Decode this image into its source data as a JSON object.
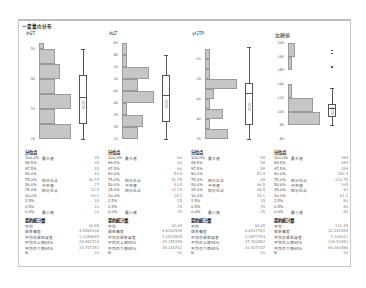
{
  "title": "一変量の分布",
  "colors": {
    "bar_fill": "#c6c6c6",
    "bar_stroke": "#9a9a9a",
    "box_stroke": "#555555",
    "frame": "#c8c8c8"
  },
  "quantile_header": "分位点",
  "summary_header": "要約統計量",
  "quantile_levels": [
    "100.0%",
    "99.5%",
    "97.5%",
    "90.0%",
    "75.0%",
    "50.0%",
    "25.0%",
    "10.0%",
    "2.5%",
    "0.5%",
    "0.0%"
  ],
  "quantile_labels": [
    "最大値",
    "",
    "",
    "",
    "四分位点",
    "中央値",
    "四分位点",
    "",
    "",
    "",
    "最小値"
  ],
  "summary_labels": [
    "平均",
    "標準偏差",
    "平均の標準誤差",
    "平均の上側95%",
    "平均の下側95%",
    "N"
  ],
  "columns": [
    {
      "name": "AST",
      "ticks": [
        "35",
        "30",
        "25",
        "20"
      ],
      "quantiles": [
        "35",
        "35",
        "35",
        "33",
        "30.75",
        "27",
        "22.5",
        "20.1",
        "20",
        "20",
        "20"
      ],
      "summary": [
        "26.85",
        "4.5569436",
        "1.0189645",
        "28.982718",
        "24.717282",
        "20"
      ]
    },
    {
      "name": "ALT",
      "ticks": [
        "65",
        "60",
        "55",
        "50",
        "45",
        "40",
        "35",
        "30",
        "25"
      ],
      "quantiles": [
        "60",
        "60",
        "60",
        "54.9",
        "51.75",
        "43.5",
        "32.25",
        "28.2",
        "25",
        "25",
        "25"
      ],
      "summary": [
        "42.65",
        "9.6262538",
        "2.1524925",
        "47.155258",
        "38.144742",
        "20"
      ]
    },
    {
      "name": "γGTP",
      "ticks": [
        "55",
        "50",
        "45",
        "40",
        "35"
      ],
      "quantiles": [
        "58",
        "58",
        "58",
        "52.9",
        "49",
        "46.5",
        "38.5",
        "35.1",
        "35",
        "35",
        "35"
      ],
      "summary": [
        "44.65",
        "6.6512761",
        "1.4872793",
        "47.762853",
        "41.537147",
        "20"
      ]
    },
    {
      "name": "血糖値",
      "ticks": [
        "200",
        "180",
        "160",
        "140",
        "120",
        "100",
        "80",
        "60"
      ],
      "quantiles": [
        "189",
        "189",
        "189",
        "182.9",
        "110.75",
        "105",
        "92",
        "81.2",
        "80",
        "80",
        "80"
      ],
      "summary": [
        "111.45",
        "32.241849",
        "7.209411",
        "126.53951",
        "96.360486",
        "20"
      ]
    }
  ],
  "chart_data": [
    {
      "type": "histogram+boxplot",
      "title": "AST",
      "ylim": [
        20,
        36
      ],
      "bins": [
        {
          "from": 20,
          "to": 22.5,
          "count": 6
        },
        {
          "from": 22.5,
          "to": 25,
          "count": 3
        },
        {
          "from": 25,
          "to": 27.5,
          "count": 6
        },
        {
          "from": 27.5,
          "to": 30,
          "count": 3
        },
        {
          "from": 30,
          "to": 32.5,
          "count": 4
        },
        {
          "from": 32.5,
          "to": 35,
          "count": 3
        },
        {
          "from": 35,
          "to": 37.5,
          "count": 1
        }
      ],
      "box": {
        "min": 20,
        "q1": 22.5,
        "median": 27,
        "q3": 30.75,
        "max": 35,
        "mean": 26.85
      }
    },
    {
      "type": "histogram+boxplot",
      "title": "ALT",
      "ylim": [
        25,
        65
      ],
      "bins": [
        {
          "from": 25,
          "to": 30,
          "count": 3
        },
        {
          "from": 30,
          "to": 35,
          "count": 4
        },
        {
          "from": 35,
          "to": 40,
          "count": 1
        },
        {
          "from": 40,
          "to": 45,
          "count": 6
        },
        {
          "from": 45,
          "to": 50,
          "count": 3
        },
        {
          "from": 50,
          "to": 55,
          "count": 5
        },
        {
          "from": 55,
          "to": 60,
          "count": 1
        },
        {
          "from": 60,
          "to": 65,
          "count": 1
        }
      ],
      "box": {
        "min": 25,
        "q1": 32.25,
        "median": 43.5,
        "q3": 51.75,
        "max": 60,
        "mean": 42.65
      }
    },
    {
      "type": "histogram+boxplot",
      "title": "γGTP",
      "ylim": [
        35,
        59
      ],
      "bins": [
        {
          "from": 35,
          "to": 37.5,
          "count": 5
        },
        {
          "from": 37.5,
          "to": 40,
          "count": 1
        },
        {
          "from": 40,
          "to": 42.5,
          "count": 4
        },
        {
          "from": 42.5,
          "to": 45,
          "count": 1
        },
        {
          "from": 45,
          "to": 47.5,
          "count": 2
        },
        {
          "from": 47.5,
          "to": 50,
          "count": 7
        },
        {
          "from": 50,
          "to": 52.5,
          "count": 1
        },
        {
          "from": 52.5,
          "to": 55,
          "count": 1
        },
        {
          "from": 55,
          "to": 57.5,
          "count": 1
        }
      ],
      "box": {
        "min": 35,
        "q1": 38.5,
        "median": 46.5,
        "q3": 49,
        "max": 58,
        "mean": 44.65
      }
    },
    {
      "type": "histogram+boxplot",
      "title": "血糖値",
      "ylim": [
        60,
        200
      ],
      "bins": [
        {
          "from": 80,
          "to": 100,
          "count": 9
        },
        {
          "from": 100,
          "to": 120,
          "count": 7
        },
        {
          "from": 120,
          "to": 140,
          "count": 1
        },
        {
          "from": 160,
          "to": 180,
          "count": 1
        },
        {
          "from": 180,
          "to": 200,
          "count": 2
        }
      ],
      "box": {
        "min": 80,
        "q1": 92,
        "median": 105,
        "q3": 110.75,
        "max": 135,
        "mean": 111.45,
        "outliers": [
          165,
          185,
          189
        ]
      }
    }
  ]
}
